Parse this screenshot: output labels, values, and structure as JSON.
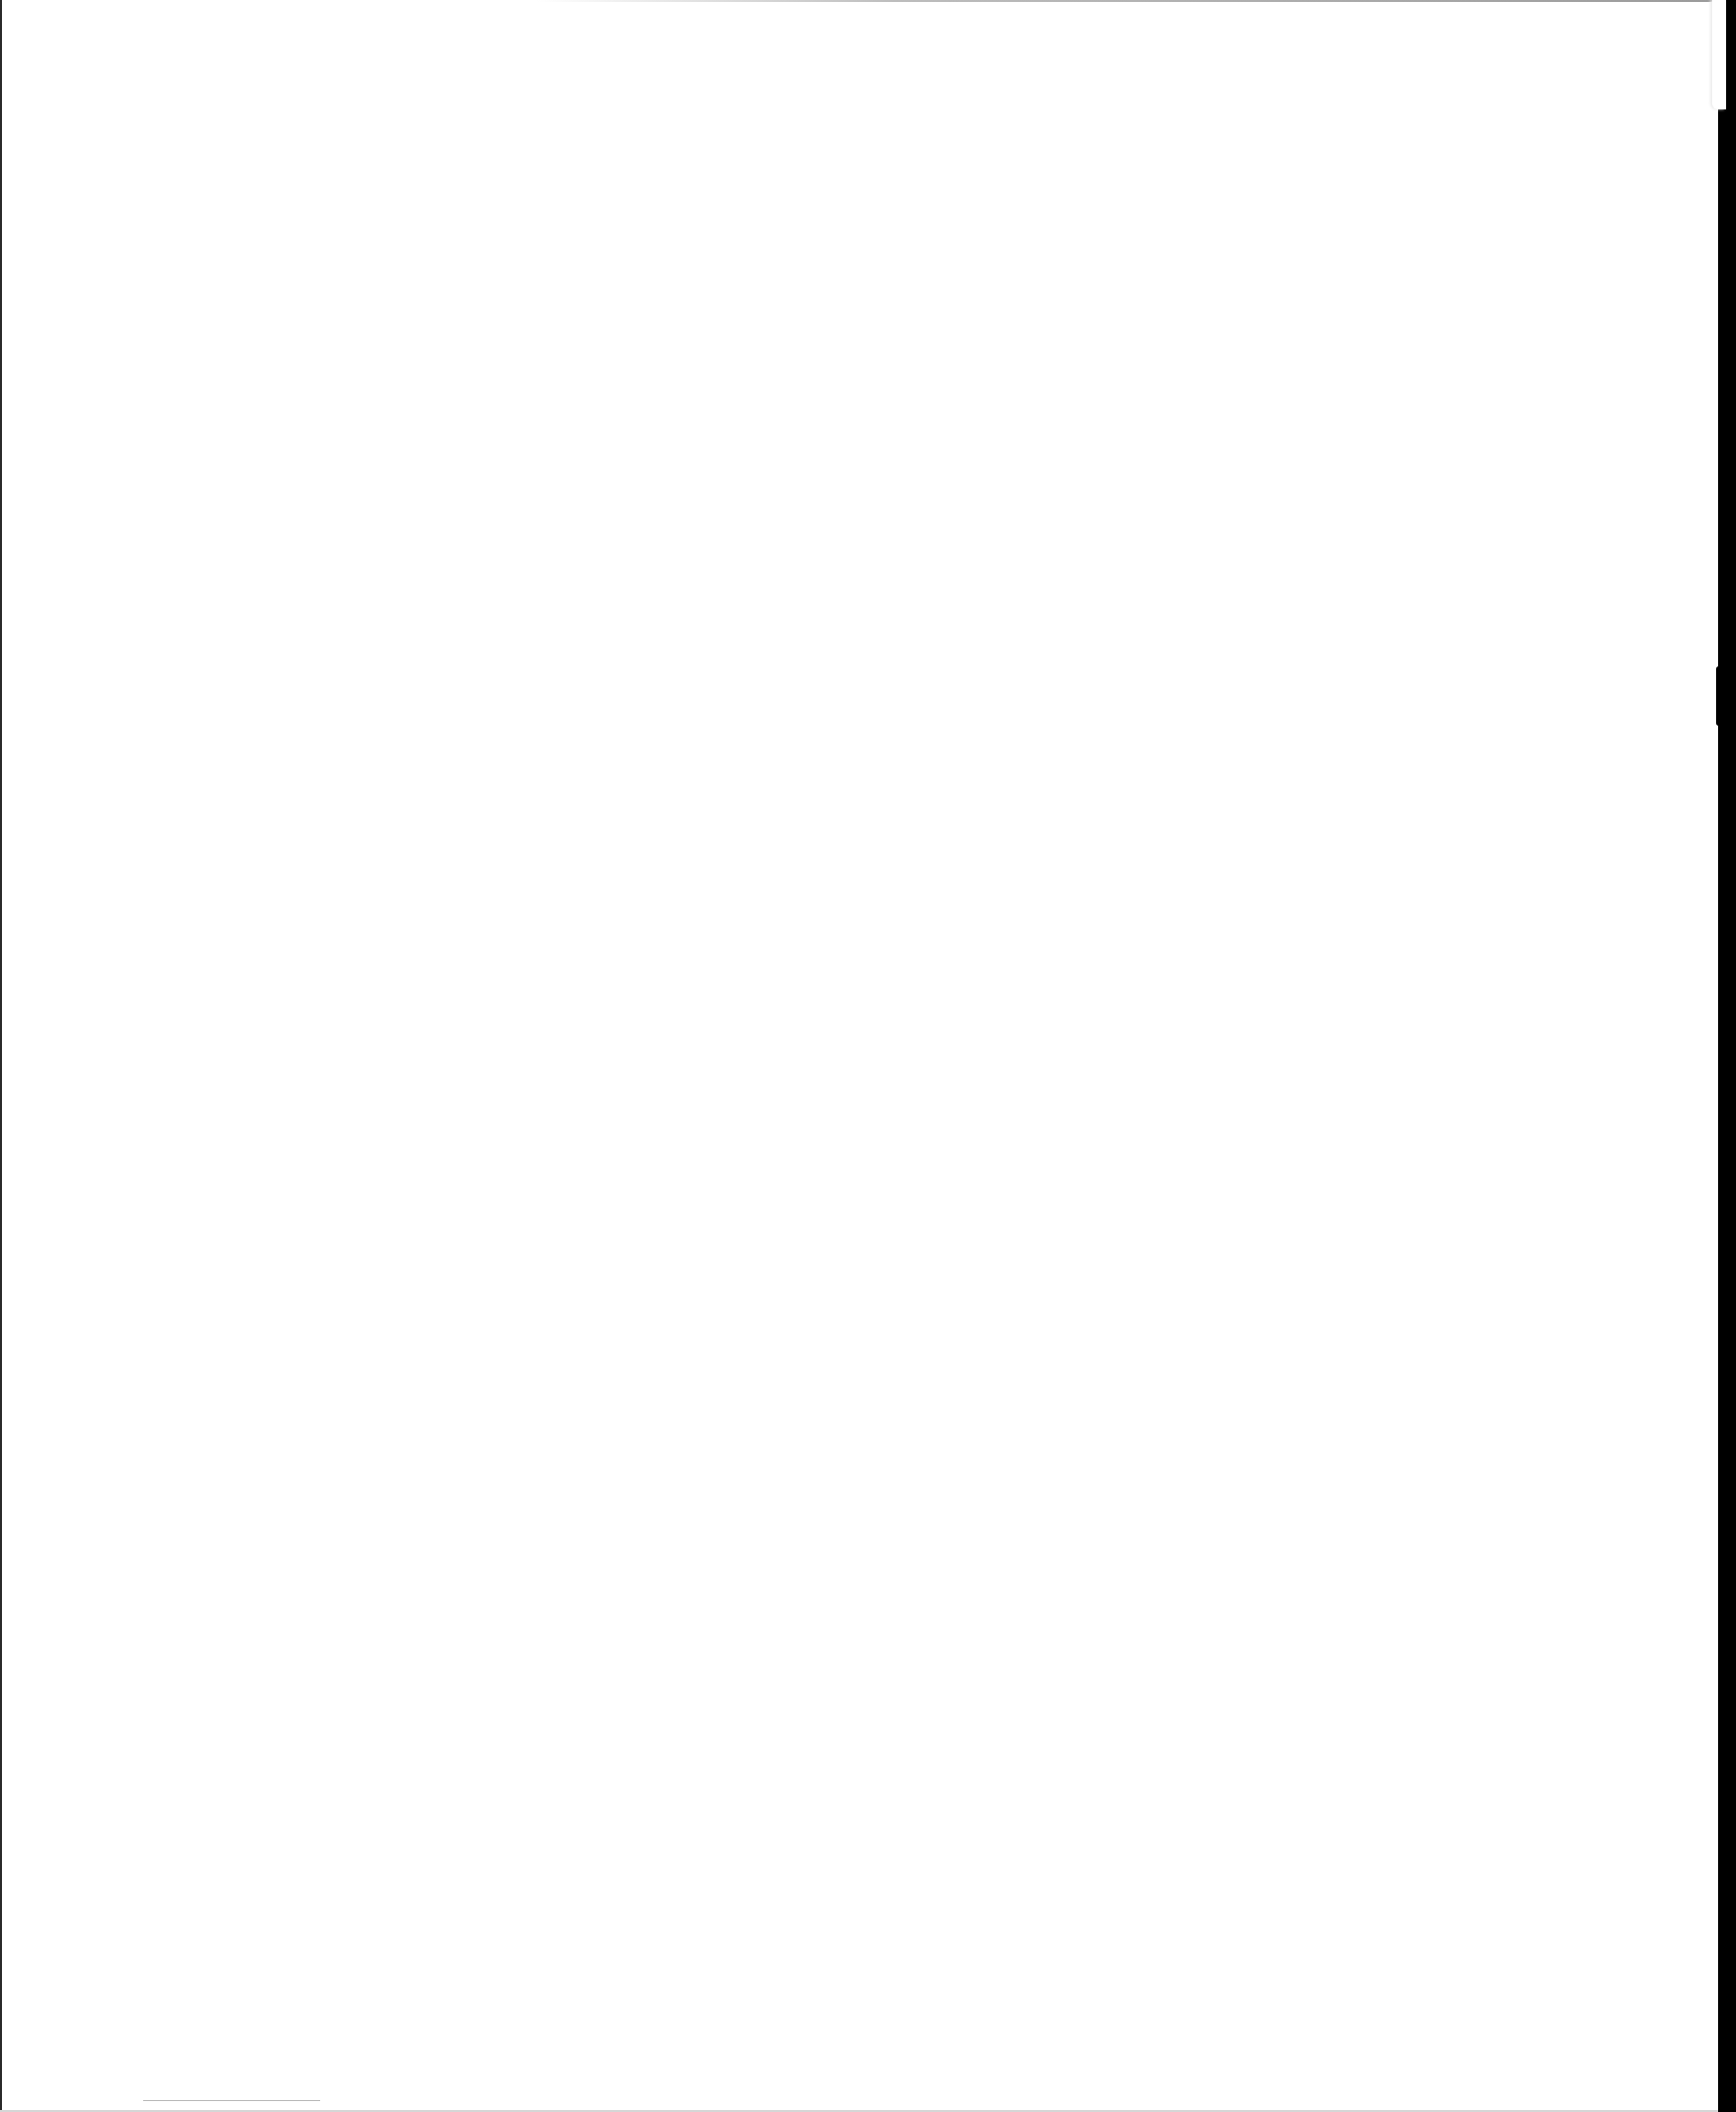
{
  "document": {
    "type": "scanned page",
    "content": "",
    "background_color": "#ffffff",
    "scan_border_color": "#000000",
    "footnote_rule_color": "#b8b8b8"
  }
}
